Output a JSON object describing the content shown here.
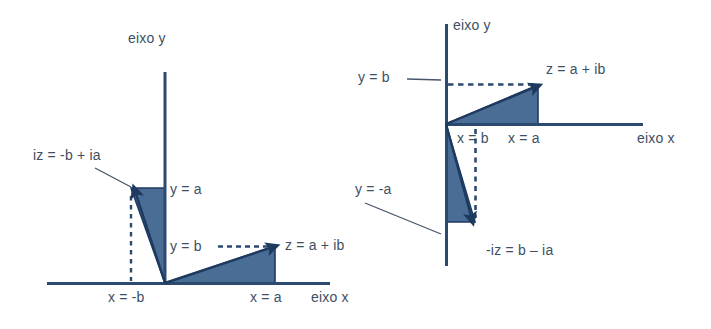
{
  "figure": {
    "type": "diagram",
    "background_color": "#ffffff",
    "fill_color": "#4a6d96",
    "stroke_color": "#1f3a5f",
    "text_color": "#3d4f63",
    "panels": [
      {
        "id": "left-panel",
        "name": "multiplicacao-por-i",
        "axes": {
          "y_axis_label": "eixo y",
          "x_axis_label": "eixo x"
        },
        "labels": [
          {
            "name": "vector-iz-label",
            "text": "iz = -b + ia"
          },
          {
            "name": "y-equals-a-label",
            "text": "y = a"
          },
          {
            "name": "y-equals-b-label",
            "text": "y = b"
          },
          {
            "name": "vector-z-label",
            "text": "z = a + ib"
          },
          {
            "name": "x-equals-minus-b-label",
            "text": "x = -b"
          },
          {
            "name": "x-equals-a-label",
            "text": "x = a"
          }
        ],
        "vectors": [
          {
            "name": "vector-z",
            "label": "z = a + ib",
            "from": [
              0,
              0
            ],
            "to": [
              110,
              36
            ]
          },
          {
            "name": "vector-iz",
            "label": "iz = -b + ia",
            "from": [
              0,
              0
            ],
            "to": [
              -34,
              93
            ]
          }
        ]
      },
      {
        "id": "right-panel",
        "name": "multiplicacao-por-menos-i",
        "axes": {
          "y_axis_label": "eixo y",
          "x_axis_label": "eixo x"
        },
        "labels": [
          {
            "name": "y-equals-b-label",
            "text": "y = b"
          },
          {
            "name": "vector-z-label",
            "text": "z = a + ib"
          },
          {
            "name": "x-equals-b-label",
            "text": "x = b"
          },
          {
            "name": "x-equals-a-label",
            "text": "x = a"
          },
          {
            "name": "y-equals-minus-a-label",
            "text": "y = -a"
          },
          {
            "name": "vector-minus-iz-label",
            "text": "-iz = b – ia"
          }
        ],
        "vectors": [
          {
            "name": "vector-z",
            "label": "z = a + ib",
            "from": [
              0,
              0
            ],
            "to": [
              92,
              39
            ]
          },
          {
            "name": "vector-minus-iz",
            "label": "-iz = b – ia",
            "from": [
              0,
              0
            ],
            "to": [
              29,
              -98
            ]
          }
        ]
      }
    ]
  }
}
